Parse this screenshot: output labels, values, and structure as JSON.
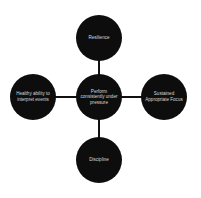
{
  "diagram": {
    "type": "hub-and-spoke",
    "colors": {
      "node_fill": "#0d0d0d",
      "node_text": "#d8d8d8",
      "connector": "#111111",
      "background": "#ffffff"
    },
    "center": {
      "label": "Perform consistently under pressure"
    },
    "spokes": {
      "top": {
        "label": "Resilience"
      },
      "left": {
        "label": "Healthy ability to interpret events"
      },
      "right": {
        "label": "Sustained Appropriate Focus"
      },
      "bottom": {
        "label": "Discipline"
      }
    }
  }
}
